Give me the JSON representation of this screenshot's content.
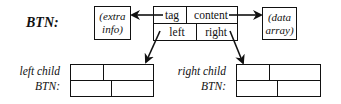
{
  "diagram": {
    "node_label": "BTN:",
    "node": {
      "top_left": "tag",
      "top_right": "content",
      "bottom_left": "left",
      "bottom_right": "right"
    },
    "extra_info_box": {
      "line1": "(extra",
      "line2": "info)"
    },
    "data_array_box": {
      "line1": "(data",
      "line2": "array)"
    },
    "left_child_label": {
      "line1": "left child",
      "line2": "BTN:"
    },
    "right_child_label": {
      "line1": "right child",
      "line2": "BTN:"
    },
    "arrows": [
      {
        "from": "tag",
        "to": "extra_info_box"
      },
      {
        "from": "content",
        "to": "data_array_box"
      },
      {
        "from": "left",
        "to": "left_child_node"
      },
      {
        "from": "right",
        "to": "right_child_node"
      }
    ]
  }
}
